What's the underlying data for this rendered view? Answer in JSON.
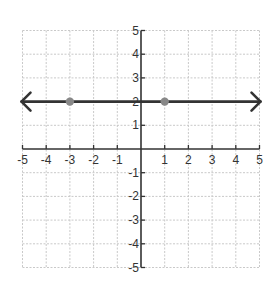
{
  "chart_data": {
    "type": "line",
    "title": "",
    "xlabel": "",
    "ylabel": "",
    "xlim": [
      -5,
      5
    ],
    "ylim": [
      -5,
      5
    ],
    "grid": true,
    "x_ticks": [
      -5,
      -4,
      -3,
      -2,
      -1,
      1,
      2,
      3,
      4,
      5
    ],
    "y_ticks": [
      5,
      4,
      3,
      2,
      1,
      -1,
      -2,
      -3,
      -4,
      -5
    ],
    "series": [
      {
        "name": "y = 2",
        "equation": "y = 2",
        "kind": "line with arrows both ends",
        "x": [
          -5,
          5
        ],
        "y": [
          2,
          2
        ],
        "color": "#333333"
      }
    ],
    "points": [
      {
        "x": -3,
        "y": 2,
        "color": "#888888"
      },
      {
        "x": 1,
        "y": 2,
        "color": "#888888"
      }
    ]
  },
  "colors": {
    "axis": "#333333",
    "grid": "#c9c9c9",
    "line": "#333333",
    "point": "#888888"
  }
}
